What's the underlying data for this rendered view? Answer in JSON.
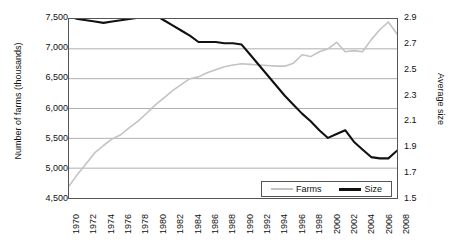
{
  "chart_data": {
    "type": "line",
    "title": "",
    "xlabel": "",
    "ylabel": "Number of farms (thousands)",
    "y2label": "Average size",
    "grid": true,
    "legend_position": "bottom-right",
    "x": [
      1970,
      1971,
      1972,
      1973,
      1974,
      1975,
      1976,
      1977,
      1978,
      1979,
      1980,
      1981,
      1982,
      1983,
      1984,
      1985,
      1986,
      1987,
      1988,
      1989,
      1990,
      1991,
      1992,
      1993,
      1994,
      1995,
      1996,
      1997,
      1998,
      1999,
      2000,
      2001,
      2002,
      2003,
      2004,
      2005,
      2006,
      2007,
      2008
    ],
    "xticks": [
      "1970",
      "1972",
      "1974",
      "1976",
      "1978",
      "1980",
      "1982",
      "1984",
      "1986",
      "1988",
      "1990",
      "1992",
      "1994",
      "1996",
      "1998",
      "2000",
      "2002",
      "2004",
      "2006",
      "2008"
    ],
    "yticks_left": [
      "4,500",
      "5,000",
      "5,500",
      "6,000",
      "6,500",
      "7,000",
      "7,500"
    ],
    "yticks_right": [
      "1.5",
      "1.7",
      "1.9",
      "2.1",
      "2.3",
      "2.5",
      "2.7",
      "2.9"
    ],
    "ylim": [
      4500,
      7500
    ],
    "y2lim": [
      1.5,
      2.9
    ],
    "series": [
      {
        "name": "Farms",
        "axis": "left",
        "color": "#c3c3c3",
        "values": [
          4700,
          4900,
          5080,
          5260,
          5380,
          5490,
          5560,
          5680,
          5790,
          5920,
          6060,
          6180,
          6300,
          6400,
          6500,
          6530,
          6600,
          6650,
          6700,
          6730,
          6750,
          6740,
          6730,
          6720,
          6710,
          6710,
          6760,
          6900,
          6870,
          6950,
          7000,
          7110,
          6950,
          6970,
          6950,
          7150,
          7320,
          7450,
          7250
        ]
      },
      {
        "name": "Size",
        "axis": "right",
        "color": "#111111",
        "values": [
          2.92,
          2.9,
          2.89,
          2.88,
          2.87,
          2.88,
          2.89,
          2.9,
          2.91,
          2.92,
          2.93,
          2.89,
          2.85,
          2.81,
          2.77,
          2.72,
          2.72,
          2.72,
          2.71,
          2.71,
          2.7,
          2.62,
          2.54,
          2.46,
          2.38,
          2.3,
          2.23,
          2.16,
          2.1,
          2.03,
          1.97,
          2.0,
          2.03,
          1.94,
          1.88,
          1.82,
          1.81,
          1.81,
          1.87
        ]
      }
    ]
  },
  "legend": {
    "items": [
      {
        "label": "Farms",
        "swatch": "farms"
      },
      {
        "label": "Size",
        "swatch": "size"
      }
    ]
  }
}
